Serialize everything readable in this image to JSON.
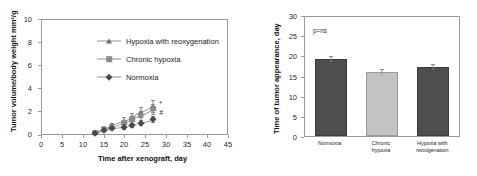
{
  "figure": {
    "background": "#ffffff",
    "panel_count": 2
  },
  "chart_data": [
    {
      "type": "line",
      "panel": "left",
      "title": "",
      "xlabel": "Time after xenograft, day",
      "ylabel": "Tumor volume/body weight mm3/g",
      "ylabel_display": "Tumor volume/body weight mm³/g",
      "xlim": [
        0,
        45
      ],
      "ylim": [
        0,
        10
      ],
      "xticks": [
        0,
        5,
        10,
        15,
        20,
        25,
        30,
        35,
        40,
        45
      ],
      "yticks": [
        0,
        2,
        4,
        6,
        8,
        10
      ],
      "grid": false,
      "legend_position": "inside-upper-left",
      "error_bars": "SEM",
      "annotations": [
        {
          "text": "*",
          "x": 28.5,
          "y": 2.95,
          "note": "significance marker for Hypoxia with reoxygenation"
        },
        {
          "text": "#",
          "x": 28.5,
          "y": 2.2,
          "note": "significance marker for Chronic hypoxia"
        }
      ],
      "series": [
        {
          "name": "Hypoxia with reoxygenation",
          "marker": "triangle",
          "color": "#6e6e6e",
          "x": [
            13,
            15,
            17,
            20,
            22,
            24,
            27
          ],
          "values": [
            0.15,
            0.42,
            0.78,
            1.18,
            1.48,
            1.95,
            2.45
          ],
          "errors": [
            0.08,
            0.12,
            0.22,
            0.3,
            0.35,
            0.42,
            0.5
          ]
        },
        {
          "name": "Chronic hypoxia",
          "marker": "square",
          "color": "#8a8a8a",
          "x": [
            13,
            15,
            17,
            20,
            22,
            24,
            27
          ],
          "values": [
            0.13,
            0.4,
            0.62,
            0.98,
            1.3,
            1.62,
            2.22
          ],
          "errors": [
            0.07,
            0.1,
            0.18,
            0.26,
            0.3,
            0.36,
            0.44
          ]
        },
        {
          "name": "Normoxia",
          "marker": "diamond",
          "color": "#4a4a4a",
          "x": [
            13,
            15,
            17,
            20,
            22,
            24,
            27
          ],
          "values": [
            0.12,
            0.38,
            0.52,
            0.62,
            0.78,
            1.0,
            1.3
          ],
          "errors": [
            0.06,
            0.08,
            0.12,
            0.14,
            0.16,
            0.2,
            0.24
          ]
        }
      ]
    },
    {
      "type": "bar",
      "panel": "right",
      "title": "",
      "xlabel": "",
      "ylabel": "Time of tumor appearance, day",
      "ylim": [
        0,
        30
      ],
      "yticks": [
        0,
        5,
        10,
        15,
        20,
        25,
        30
      ],
      "grid": false,
      "annotation": "p=ns",
      "categories": [
        "Normoxia",
        "Chronic hypoxia",
        "Hypoxia with reoxigenation"
      ],
      "category_labels": [
        "Normoxia",
        "Chronic\nhypoxia",
        "Hypoxia with\nreoxigenation"
      ],
      "values": [
        19.5,
        16.2,
        17.3
      ],
      "errors": [
        0.7,
        0.8,
        0.9
      ],
      "colors": [
        "#4e4e4e",
        "#c2c2c2",
        "#4e4e4e"
      ]
    }
  ],
  "left": {
    "ylabel": "Tumor volume/body weight mm³/g",
    "xlabel": "Time after xenograft, day",
    "yticks": [
      "10",
      "8",
      "6",
      "4",
      "2",
      "0"
    ],
    "xticks": [
      "0",
      "5",
      "10",
      "15",
      "20",
      "25",
      "30",
      "35",
      "40",
      "45"
    ],
    "legend": [
      {
        "label": "Hypoxia with reoxygenation",
        "marker": "triangle-marker-icon"
      },
      {
        "label": "Chronic hypoxia",
        "marker": "square-marker-icon"
      },
      {
        "label": "Normoxia",
        "marker": "diamond-marker-icon"
      }
    ],
    "sig_star": "*",
    "sig_hash": "#"
  },
  "right": {
    "ylabel": "Time of tumor appearance, day",
    "yticks": [
      "30",
      "25",
      "20",
      "15",
      "10",
      "5",
      "0"
    ],
    "pvalue": "p=ns",
    "bars": [
      {
        "label_line1": "Normoxia",
        "label_line2": "",
        "value": 19.5,
        "error": 0.7,
        "color": "#4e4e4e"
      },
      {
        "label_line1": "Chronic",
        "label_line2": "hypoxia",
        "value": 16.2,
        "error": 0.8,
        "color": "#c2c2c2"
      },
      {
        "label_line1": "Hypoxia with",
        "label_line2": "reoxigenation",
        "value": 17.3,
        "error": 0.9,
        "color": "#4e4e4e"
      }
    ]
  }
}
